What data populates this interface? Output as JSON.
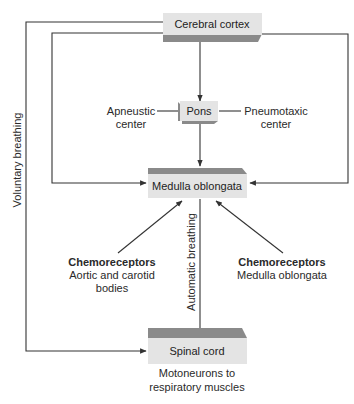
{
  "diagram": {
    "nodes": {
      "cortex": {
        "label": "Cerebral cortex"
      },
      "pons": {
        "label": "Pons"
      },
      "medulla": {
        "label": "Medulla oblongata"
      },
      "spinal": {
        "label": "Spinal cord",
        "sublabel_1": "Motoneurons to",
        "sublabel_2": "respiratory muscles"
      }
    },
    "annotations": {
      "apneustic_1": "Apneustic",
      "apneustic_2": "center",
      "pneumotaxic_1": "Pneumotaxic",
      "pneumotaxic_2": "center",
      "voluntary": "Voluntary breathing",
      "automatic": "Automatic breathing",
      "chemo_left_title": "Chemoreceptors",
      "chemo_left_1": "Aortic and carotid",
      "chemo_left_2": "bodies",
      "chemo_right_title": "Chemoreceptors",
      "chemo_right_1": "Medulla oblongata"
    },
    "edges": [
      {
        "from": "cortex",
        "to": "pons"
      },
      {
        "from": "pons",
        "to": "medulla"
      },
      {
        "from": "cortex",
        "to": "medulla",
        "side": "left"
      },
      {
        "from": "cortex",
        "to": "medulla",
        "side": "right"
      },
      {
        "from": "cortex",
        "to": "spinal",
        "label": "Voluntary breathing"
      },
      {
        "from": "medulla",
        "to": "spinal",
        "label": "Automatic breathing"
      },
      {
        "from": "chemoreceptors-peripheral",
        "to": "medulla"
      },
      {
        "from": "chemoreceptors-central",
        "to": "medulla"
      }
    ],
    "colors": {
      "box_face": "#e4e4e4",
      "box_edge": "#8a8a8a",
      "line": "#333333"
    }
  }
}
